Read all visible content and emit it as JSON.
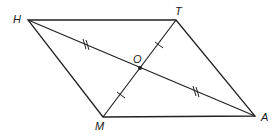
{
  "figure": {
    "type": "parallelogram",
    "points": {
      "H": {
        "label": "H",
        "x": 28,
        "y": 20
      },
      "T": {
        "label": "T",
        "x": 176,
        "y": 20
      },
      "A": {
        "label": "A",
        "x": 255,
        "y": 116
      },
      "M": {
        "label": "M",
        "x": 103,
        "y": 117
      },
      "O": {
        "label": "O",
        "x": 140,
        "y": 69
      }
    },
    "sides": [
      "HT",
      "TA",
      "AM",
      "MH"
    ],
    "diagonals": [
      "HA",
      "TM"
    ],
    "tick_marks": {
      "HO_OA": "double",
      "TO_OM": "single"
    },
    "colors": {
      "stroke": "#222222"
    }
  }
}
